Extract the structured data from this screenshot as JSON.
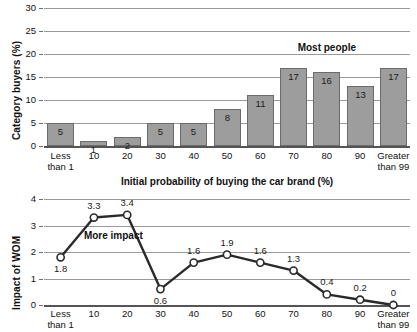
{
  "chart_data": [
    {
      "type": "bar",
      "title": "",
      "xlabel": "Initial probability of buying the car brand (%)",
      "ylabel": "Category buyers (%)",
      "categories": [
        "Less than 1",
        "10",
        "20",
        "30",
        "40",
        "50",
        "60",
        "70",
        "80",
        "90",
        "Greater than 99"
      ],
      "category_lines": [
        [
          "Less",
          "than 1"
        ],
        [
          "10",
          ""
        ],
        [
          "20",
          ""
        ],
        [
          "30",
          ""
        ],
        [
          "40",
          ""
        ],
        [
          "50",
          ""
        ],
        [
          "60",
          ""
        ],
        [
          "70",
          ""
        ],
        [
          "80",
          ""
        ],
        [
          "90",
          ""
        ],
        [
          "Greater",
          "than 99"
        ]
      ],
      "values": [
        5,
        1,
        2,
        5,
        5,
        8,
        11,
        17,
        16,
        13,
        17
      ],
      "value_labels": [
        "5",
        "1",
        "2",
        "5",
        "5",
        "8",
        "11",
        "17",
        "16",
        "13",
        "17"
      ],
      "ylim": [
        0,
        30
      ],
      "yticks": [
        0,
        5,
        10,
        15,
        20,
        25,
        30
      ],
      "ytick_labels": [
        "0",
        "5",
        "10",
        "15",
        "20",
        "25",
        "30"
      ],
      "grid": true,
      "legend": "none",
      "annotations": [
        {
          "text": "Most people",
          "x_category": "80",
          "y_value": 21
        }
      ],
      "bar_fill": "#9d9d9d",
      "bar_stroke": "#6b6b6b"
    },
    {
      "type": "line",
      "title": "",
      "xlabel": "",
      "ylabel": "Impact of WOM",
      "categories": [
        "Less than 1",
        "10",
        "20",
        "30",
        "40",
        "50",
        "60",
        "70",
        "80",
        "90",
        "Greater than 99"
      ],
      "category_lines": [
        [
          "Less",
          "than 1"
        ],
        [
          "10",
          ""
        ],
        [
          "20",
          ""
        ],
        [
          "30",
          ""
        ],
        [
          "40",
          ""
        ],
        [
          "50",
          ""
        ],
        [
          "60",
          ""
        ],
        [
          "70",
          ""
        ],
        [
          "80",
          ""
        ],
        [
          "90",
          ""
        ],
        [
          "Greater",
          "than 99"
        ]
      ],
      "values": [
        1.8,
        3.3,
        3.4,
        0.6,
        1.6,
        1.9,
        1.6,
        1.3,
        0.4,
        0.2,
        0
      ],
      "value_labels": [
        "1.8",
        "3.3",
        "3.4",
        "0.6",
        "1.6",
        "1.9",
        "1.6",
        "1.3",
        "0.4",
        "0.2",
        "0"
      ],
      "label_positions": [
        "below",
        "above",
        "above",
        "below",
        "above",
        "above",
        "above",
        "above",
        "above",
        "above",
        "above"
      ],
      "ylim": [
        0,
        4
      ],
      "yticks": [
        0,
        1,
        2,
        3,
        4
      ],
      "ytick_labels": [
        "0",
        "1",
        "2",
        "3",
        "4"
      ],
      "grid": true,
      "legend": "none",
      "annotations": [
        {
          "text": "More impact",
          "x_category": "10",
          "y_value": 2.55
        }
      ],
      "line_color": "#2a2a2a",
      "marker_fill": "#ffffff",
      "marker_stroke": "#2a2a2a"
    }
  ],
  "shared": {
    "axis_title": "Initial probability of buying the car brand (%)"
  }
}
